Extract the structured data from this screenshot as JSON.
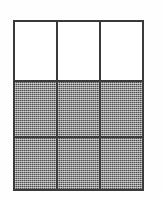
{
  "figure": {
    "name": "fraction-area-model",
    "shape": "rectangle",
    "rows": 3,
    "columns": 3,
    "total_parts": 9,
    "shaded_parts": 6,
    "unshaded_parts": 3,
    "fraction_shaded": "6/9",
    "colors": {
      "background": "#fefefe",
      "grid_line": "#3a3a3a",
      "shaded_fill": "#8e8e8e",
      "unshaded_fill": "#ffffff"
    },
    "cells": [
      {
        "row": 1,
        "col": 1,
        "state": "unshaded"
      },
      {
        "row": 1,
        "col": 2,
        "state": "unshaded"
      },
      {
        "row": 1,
        "col": 3,
        "state": "unshaded"
      },
      {
        "row": 2,
        "col": 1,
        "state": "shaded"
      },
      {
        "row": 2,
        "col": 2,
        "state": "shaded"
      },
      {
        "row": 2,
        "col": 3,
        "state": "shaded"
      },
      {
        "row": 3,
        "col": 1,
        "state": "shaded"
      },
      {
        "row": 3,
        "col": 2,
        "state": "shaded"
      },
      {
        "row": 3,
        "col": 3,
        "state": "shaded"
      }
    ]
  }
}
